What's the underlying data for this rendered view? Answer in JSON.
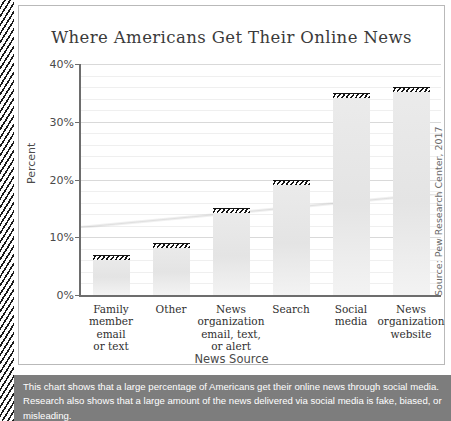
{
  "chart_data": {
    "type": "bar",
    "title": "Where Americans Get Their Online News",
    "xlabel": "News Source",
    "ylabel": "Percent",
    "ylim": [
      0,
      40
    ],
    "yticks": [
      "0%",
      "10%",
      "20%",
      "30%",
      "40%"
    ],
    "ytick_values": [
      0,
      10,
      20,
      30,
      40
    ],
    "grid": true,
    "legend": null,
    "source": "Source: Pew Research Center, 2017",
    "categories": [
      "Family\nmember\nemail\nor text",
      "Other",
      "News\norganization\nemail, text,\nor alert",
      "Search",
      "Social\nmedia",
      "News\norganization\nwebsite"
    ],
    "values": [
      7,
      9,
      15,
      20,
      35,
      36
    ],
    "bars": [
      {
        "label": "Family member email or text",
        "label_lines": [
          "Family",
          "member",
          "email",
          "or text"
        ],
        "value": 7
      },
      {
        "label": "Other",
        "label_lines": [
          "Other"
        ],
        "value": 9
      },
      {
        "label": "News organization email, text, or alert",
        "label_lines": [
          "News",
          "organization",
          "email, text,",
          "or alert"
        ],
        "value": 15
      },
      {
        "label": "Search",
        "label_lines": [
          "Search"
        ],
        "value": 20
      },
      {
        "label": "Social media",
        "label_lines": [
          "Social",
          "media"
        ],
        "value": 35
      },
      {
        "label": "News organization website",
        "label_lines": [
          "News",
          "organization",
          "website"
        ],
        "value": 36
      }
    ]
  },
  "caption": {
    "line1": "This chart shows that a large percentage of Americans get their online news through social media.",
    "line2": "Research also shows that a large amount of the news delivered via social media is fake, biased, or",
    "line3": "misleading."
  },
  "colors": {
    "bar_fill": "#e7e7e7",
    "bar_cap": "#151515",
    "axis": "#6d6d6d",
    "grid": "#d9d9d9",
    "caption_band": "#7d7d7d",
    "frame": "#b9b9b9"
  }
}
